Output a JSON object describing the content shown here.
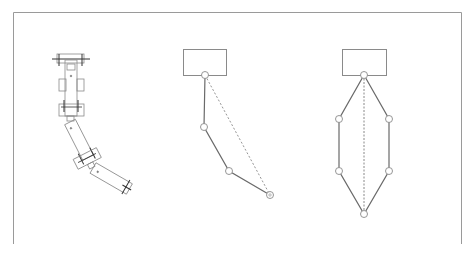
{
  "colors": {
    "line": "#7a7a7a",
    "frame": "#9a9a9a",
    "node_fill": "#ffffff",
    "mech_line": "#8a8a8a",
    "mech_dark": "#333333"
  },
  "figures": [
    {
      "id": "mechanical-arm",
      "description": "Mechanical drawing of a three-segment arm with joints"
    },
    {
      "id": "chain-model",
      "description": "Base block with 4-node chain and dashed chord"
    },
    {
      "id": "closed-loop-model",
      "description": "Base block with symmetric closed hexagonal chain and dashed center line"
    }
  ],
  "chain": {
    "base": {
      "x": 183,
      "y": 49,
      "w": 43,
      "h": 26
    },
    "nodes": [
      [
        205,
        75
      ],
      [
        204,
        127
      ],
      [
        229,
        171
      ],
      [
        270,
        195
      ]
    ],
    "chord": [
      [
        205,
        75
      ],
      [
        270,
        195
      ]
    ]
  },
  "loop": {
    "base": {
      "x": 342,
      "y": 49,
      "w": 44,
      "h": 26
    },
    "nodes": [
      [
        364,
        75
      ],
      [
        389,
        119
      ],
      [
        389,
        171
      ],
      [
        364,
        214
      ],
      [
        339,
        171
      ],
      [
        339,
        119
      ]
    ],
    "chord": [
      [
        364,
        75
      ],
      [
        364,
        214
      ]
    ]
  }
}
